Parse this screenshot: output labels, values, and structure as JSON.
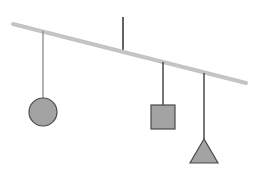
{
  "diagram": {
    "type": "balance-mobile",
    "colors": {
      "background": "#ffffff",
      "beam": "#c4c4c4",
      "string": "#2e2e2e",
      "hanger_string": "#5a5a5a",
      "shape_fill": "#a3a3a3",
      "shape_stroke": "#4a4a4a"
    },
    "beam": {
      "x1": 13,
      "y1": 24,
      "x2": 246,
      "y2": 83
    },
    "pivot": {
      "x": 123,
      "y_top": 17,
      "y_bottom": 53
    },
    "weights": [
      {
        "shape": "circle",
        "string_x": 43,
        "string_top": 31,
        "string_bottom": 98,
        "cx": 43,
        "cy": 112,
        "r": 14
      },
      {
        "shape": "square",
        "string_x": 163,
        "string_top": 62,
        "string_bottom": 105,
        "x": 151,
        "y": 105,
        "size": 24
      },
      {
        "shape": "triangle",
        "string_x": 204,
        "string_top": 73,
        "string_bottom": 139,
        "points": "204,139 190,163 218,163"
      }
    ]
  }
}
